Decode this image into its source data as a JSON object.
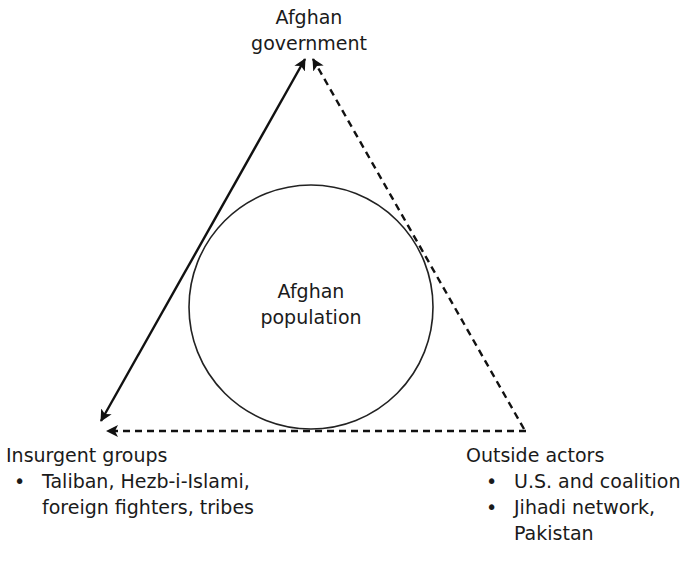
{
  "diagram": {
    "nodes": {
      "government": {
        "line1": "Afghan",
        "line2": "government"
      },
      "population": {
        "line1": "Afghan",
        "line2": "population"
      },
      "insurgents": {
        "title": "Insurgent groups",
        "bullets": [
          {
            "line1": "Taliban, Hezb-i-Islami,",
            "line2": "foreign fighters, tribes"
          }
        ]
      },
      "outside": {
        "title": "Outside actors",
        "bullets": [
          {
            "line1": "U.S. and coalition",
            "line2": ""
          },
          {
            "line1": "Jihadi network,",
            "line2": "Pakistan"
          }
        ]
      }
    },
    "bullet_glyph": "•",
    "edges": [
      {
        "from": "insurgents",
        "to": "government",
        "style": "solid",
        "arrows": "both"
      },
      {
        "from": "outside",
        "to": "government",
        "style": "dashed",
        "arrows": "end"
      },
      {
        "from": "outside",
        "to": "insurgents",
        "style": "dashed",
        "arrows": "end"
      }
    ],
    "colors": {
      "line": "#111111",
      "background": "#ffffff"
    }
  }
}
